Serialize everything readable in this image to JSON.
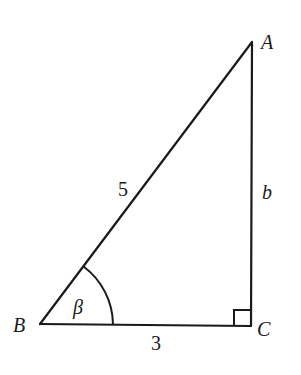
{
  "diagram": {
    "type": "right-triangle",
    "vertices": {
      "A": {
        "label": "A",
        "x": 252,
        "y": 42
      },
      "B": {
        "label": "B",
        "x": 40,
        "y": 324
      },
      "C": {
        "label": "C",
        "x": 251,
        "y": 326
      }
    },
    "sides": {
      "hypotenuse_AB": {
        "label": "5"
      },
      "side_BC": {
        "label": "3"
      },
      "side_AC": {
        "label": "b"
      }
    },
    "angle": {
      "vertex": "B",
      "label": "β"
    },
    "right_angle_at": "C",
    "colors": {
      "stroke": "#1a1a1a",
      "background": "#ffffff"
    }
  }
}
